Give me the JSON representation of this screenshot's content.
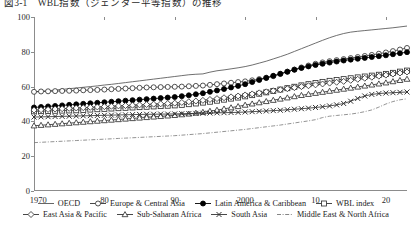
{
  "figure": {
    "title": "図3-1　WBL指数（ジェンダー平等指数）の推移"
  },
  "legend": {
    "rows": [
      [
        {
          "name": "OECD",
          "key": "plain-line",
          "color": "#555555"
        },
        {
          "name": "Europe & Central Asia",
          "key": "open-circle-line",
          "color": "#333333"
        },
        {
          "name": "Latin America & Caribbean",
          "key": "filled-circle-line",
          "color": "#000000"
        },
        {
          "name": "WBL index",
          "key": "open-square-line",
          "color": "#333333"
        }
      ],
      [
        {
          "name": "East Asia & Pacific",
          "key": "open-diamond-line",
          "color": "#333333"
        },
        {
          "name": "Sub-Saharan Africa",
          "key": "open-triangle-line",
          "color": "#333333"
        },
        {
          "name": "South Asia",
          "key": "cross-line",
          "color": "#333333"
        },
        {
          "name": "Middle East & North Africa",
          "key": "dash-dot-line",
          "color": "#777777"
        }
      ]
    ]
  },
  "chart_data": {
    "type": "line",
    "title": "図3-1　WBL指数（ジェンダー平等指数）の推移",
    "xlabel": "",
    "ylabel": "",
    "xlim": [
      1970,
      2023
    ],
    "ylim": [
      0,
      100
    ],
    "grid": false,
    "legend_position": "bottom",
    "yticks": [
      0,
      20,
      40,
      60,
      80,
      100
    ],
    "xticks": [
      1970,
      1980,
      1990,
      2000,
      2010,
      2020
    ],
    "xtick_labels": [
      "1970",
      "80",
      "90",
      "2000",
      "10",
      "20"
    ],
    "x": [
      1970,
      1971,
      1972,
      1973,
      1974,
      1975,
      1976,
      1977,
      1978,
      1979,
      1980,
      1981,
      1982,
      1983,
      1984,
      1985,
      1986,
      1987,
      1988,
      1989,
      1990,
      1991,
      1992,
      1993,
      1994,
      1995,
      1996,
      1997,
      1998,
      1999,
      2000,
      2001,
      2002,
      2003,
      2004,
      2005,
      2006,
      2007,
      2008,
      2009,
      2010,
      2011,
      2012,
      2013,
      2014,
      2015,
      2016,
      2017,
      2018,
      2019,
      2020,
      2021,
      2022,
      2023
    ],
    "series": [
      {
        "name": "OECD",
        "marker": "none",
        "linestyle": "solid",
        "color": "#555555",
        "values": [
          57.0,
          57.3,
          57.6,
          58.0,
          58.4,
          58.8,
          59.2,
          59.6,
          60.0,
          60.4,
          60.9,
          61.3,
          61.8,
          62.3,
          62.8,
          63.3,
          63.8,
          64.3,
          64.8,
          65.3,
          65.8,
          66.3,
          66.8,
          67.1,
          67.3,
          68.3,
          69.1,
          69.6,
          70.2,
          70.8,
          71.5,
          72.4,
          73.5,
          74.6,
          75.9,
          77.2,
          78.6,
          80.2,
          81.8,
          83.4,
          85.0,
          86.6,
          88.1,
          89.4,
          90.5,
          91.3,
          91.8,
          92.2,
          92.6,
          93.0,
          93.4,
          93.8,
          94.3,
          94.8
        ]
      },
      {
        "name": "Europe & Central Asia",
        "marker": "open-circle",
        "linestyle": "solid",
        "color": "#333333",
        "values": [
          57.0,
          57.2,
          57.3,
          57.4,
          57.5,
          57.6,
          57.7,
          57.9,
          58.0,
          58.1,
          58.3,
          58.5,
          58.7,
          58.9,
          59.1,
          59.3,
          59.5,
          59.6,
          59.7,
          59.8,
          59.9,
          60.0,
          60.2,
          60.4,
          60.6,
          61.0,
          61.4,
          61.8,
          62.2,
          62.6,
          63.0,
          63.6,
          64.3,
          65.1,
          66.0,
          67.2,
          68.5,
          69.8,
          71.0,
          72.1,
          73.1,
          73.9,
          74.6,
          75.2,
          75.8,
          76.4,
          77.0,
          77.6,
          78.2,
          78.9,
          79.6,
          80.4,
          81.3,
          82.2
        ]
      },
      {
        "name": "Latin America & Caribbean",
        "marker": "filled-circle",
        "linestyle": "solid",
        "color": "#000000",
        "values": [
          48.0,
          48.3,
          48.6,
          48.9,
          49.2,
          49.5,
          49.8,
          50.1,
          50.4,
          50.7,
          51.0,
          51.3,
          51.6,
          51.9,
          52.2,
          52.5,
          52.8,
          53.1,
          53.4,
          53.7,
          54.0,
          54.5,
          55.0,
          55.6,
          56.2,
          57.0,
          57.8,
          58.6,
          59.5,
          60.4,
          61.4,
          62.6,
          63.8,
          65.0,
          66.2,
          67.4,
          68.6,
          69.7,
          70.7,
          71.6,
          72.4,
          73.1,
          73.8,
          74.4,
          75.0,
          75.5,
          76.0,
          76.5,
          77.0,
          77.5,
          78.0,
          78.6,
          79.2,
          79.8
        ]
      },
      {
        "name": "WBL index",
        "marker": "open-square",
        "linestyle": "solid",
        "color": "#333333",
        "values": [
          45.8,
          45.9,
          46.0,
          46.1,
          46.2,
          46.3,
          46.4,
          46.6,
          46.8,
          47.0,
          47.2,
          47.4,
          47.6,
          47.8,
          48.0,
          48.2,
          48.4,
          48.6,
          48.8,
          49.0,
          49.2,
          49.5,
          49.9,
          50.3,
          50.8,
          51.3,
          51.9,
          52.5,
          53.1,
          53.7,
          54.4,
          55.1,
          55.9,
          56.7,
          57.5,
          58.3,
          59.1,
          59.9,
          60.7,
          61.4,
          62.1,
          62.7,
          63.3,
          63.8,
          64.3,
          64.8,
          65.3,
          65.8,
          66.3,
          66.8,
          67.3,
          67.9,
          68.6,
          69.2
        ]
      },
      {
        "name": "East Asia & Pacific",
        "marker": "open-diamond",
        "linestyle": "solid",
        "color": "#333333",
        "values": [
          46.5,
          46.7,
          46.9,
          47.1,
          47.3,
          47.5,
          47.7,
          47.9,
          48.1,
          48.3,
          48.5,
          48.7,
          48.9,
          49.1,
          49.3,
          49.5,
          49.7,
          49.9,
          50.1,
          50.3,
          50.5,
          50.9,
          51.3,
          51.7,
          52.1,
          52.6,
          53.1,
          53.6,
          54.1,
          54.6,
          55.2,
          55.8,
          56.4,
          57.0,
          57.6,
          58.2,
          58.8,
          59.4,
          60.0,
          60.5,
          61.0,
          61.5,
          62.0,
          62.5,
          63.0,
          63.6,
          64.2,
          64.8,
          65.4,
          66.0,
          66.6,
          67.2,
          67.8,
          68.4
        ]
      },
      {
        "name": "Sub-Saharan Africa",
        "marker": "open-triangle",
        "linestyle": "solid",
        "color": "#333333",
        "values": [
          37.5,
          37.8,
          38.1,
          38.4,
          38.7,
          39.0,
          39.3,
          39.6,
          39.9,
          40.2,
          40.5,
          40.8,
          41.1,
          41.4,
          41.7,
          42.0,
          42.3,
          42.6,
          42.9,
          43.2,
          43.5,
          43.9,
          44.3,
          44.8,
          45.3,
          45.9,
          46.5,
          47.2,
          47.9,
          48.6,
          49.4,
          50.1,
          50.8,
          51.5,
          52.2,
          52.9,
          53.6,
          54.3,
          55.0,
          55.6,
          56.2,
          56.8,
          57.4,
          58.0,
          58.6,
          59.2,
          59.8,
          60.4,
          61.0,
          61.6,
          62.2,
          62.9,
          63.6,
          64.3
        ]
      },
      {
        "name": "South Asia",
        "marker": "cross",
        "linestyle": "solid",
        "color": "#333333",
        "values": [
          42.5,
          42.6,
          42.7,
          42.8,
          42.9,
          43.0,
          43.1,
          43.2,
          43.3,
          43.4,
          43.5,
          43.6,
          43.7,
          43.8,
          43.9,
          44.0,
          44.1,
          44.1,
          44.2,
          44.2,
          44.3,
          44.4,
          44.5,
          44.6,
          44.7,
          44.8,
          44.9,
          45.0,
          45.1,
          45.2,
          45.4,
          45.6,
          45.8,
          46.0,
          46.2,
          46.4,
          46.7,
          47.0,
          47.3,
          47.6,
          48.0,
          48.4,
          48.9,
          49.5,
          50.3,
          51.6,
          53.2,
          54.6,
          55.5,
          56.0,
          56.3,
          56.5,
          56.7,
          56.9
        ]
      },
      {
        "name": "Middle East & North Africa",
        "marker": "none",
        "linestyle": "dashdot",
        "color": "#777777",
        "values": [
          27.8,
          28.0,
          28.2,
          28.4,
          28.6,
          28.8,
          29.0,
          29.2,
          29.4,
          29.6,
          29.8,
          30.0,
          30.2,
          30.4,
          30.6,
          30.8,
          31.0,
          31.2,
          31.4,
          31.6,
          31.8,
          32.1,
          32.4,
          32.7,
          33.0,
          33.4,
          33.8,
          34.2,
          34.6,
          35.0,
          35.4,
          35.9,
          36.4,
          36.9,
          37.4,
          37.9,
          38.5,
          39.1,
          39.7,
          40.3,
          41.0,
          42.2,
          43.0,
          43.4,
          43.8,
          44.2,
          44.8,
          45.6,
          46.6,
          48.2,
          50.0,
          51.4,
          52.4,
          53.0
        ]
      }
    ]
  }
}
